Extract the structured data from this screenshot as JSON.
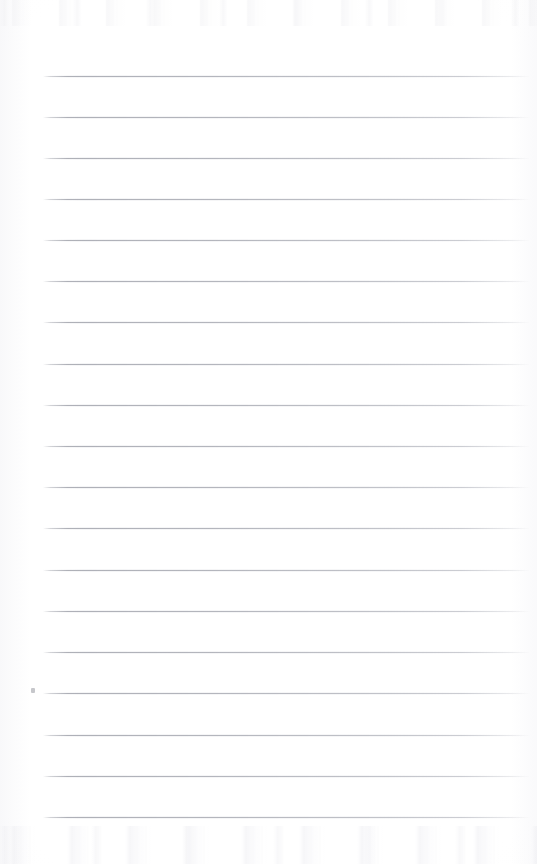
{
  "page": {
    "kind": "scanned-blank-ruled-notebook-page",
    "width": 537,
    "height": 864,
    "background_color": "#ffffff",
    "paper_tone": "#fdfdfd",
    "has_text": false,
    "handwriting": "",
    "printed_text": "",
    "header_text": "",
    "footer_text": "",
    "page_number": ""
  },
  "ruling": {
    "line_color": "#abadb5",
    "line_count": 19,
    "line_thickness_px": 1,
    "spacing_px": 41.2,
    "left_x": 43,
    "right_x": 530,
    "first_line_y": 76,
    "last_line_y": 817,
    "lines_y": [
      76,
      117,
      158,
      199,
      240,
      281,
      322,
      364,
      405,
      446,
      487,
      528,
      570,
      611,
      652,
      693,
      735,
      776,
      817
    ],
    "margin_rule": "none",
    "margin_rule_color": ""
  },
  "artifacts": {
    "speck": {
      "x": 31,
      "y": 688,
      "color": "#bcbdc2"
    },
    "scan_noise_top": true,
    "scan_noise_bottom": true,
    "edge_vignette": true
  }
}
